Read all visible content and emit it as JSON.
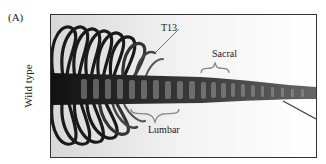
{
  "figure": {
    "panel_label": "(A)",
    "row_label": "Wild type",
    "annotations": {
      "t13": "T13",
      "sacral": "Sacral",
      "lumbar": "Lumbar"
    },
    "colors": {
      "bone_dark": "#1a1a1a",
      "bone_mid": "#555555",
      "background": "#ffffff",
      "frame": "#333333"
    }
  }
}
